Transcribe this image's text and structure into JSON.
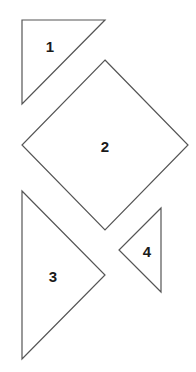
{
  "diagram": {
    "background": "#ffffff",
    "stroke_color": "#555555",
    "label_color": "#1a1a1a",
    "shapes": [
      {
        "id": "1",
        "type": "triangle",
        "label": "1",
        "points": "22,20 105,20 22,104",
        "label_pos": [
          50,
          46
        ]
      },
      {
        "id": "2",
        "type": "square",
        "label": "2",
        "points": "105,60 188,145 105,230 22,145",
        "label_pos": [
          105,
          146
        ]
      },
      {
        "id": "3",
        "type": "triangle",
        "label": "3",
        "points": "22,191 105,275 22,359",
        "label_pos": [
          53,
          276
        ]
      },
      {
        "id": "4",
        "type": "triangle",
        "label": "4",
        "points": "161,208 119,250 161,292",
        "label_pos": [
          147,
          251
        ]
      }
    ]
  }
}
